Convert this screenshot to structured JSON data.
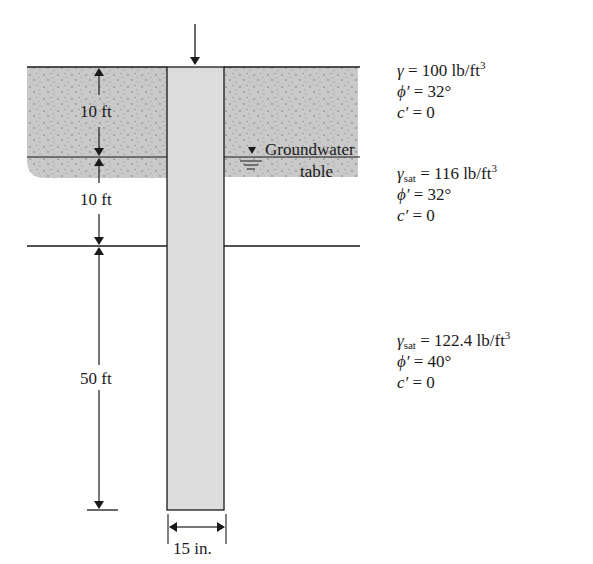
{
  "diagram": {
    "type": "pile-in-layered-soil",
    "colors": {
      "soil_fill": "#c9c9c9",
      "pile_fill": "#dcdcdc",
      "line": "#1a1a1a",
      "background": "#ffffff"
    },
    "load_arrow": "downward-load-arrow",
    "groundwater_label_line1": "Groundwater",
    "groundwater_label_line2": "table",
    "dimensions": {
      "layer1_thickness": "10 ft",
      "layer2_thickness": "10 ft",
      "layer3_thickness": "50 ft",
      "pile_diameter": "15 in."
    },
    "layers": [
      {
        "unit_weight_symbol": "γ",
        "unit_weight_sub": "",
        "unit_weight_value": "= 100 lb/ft",
        "unit_weight_exp": "3",
        "friction_angle_symbol": "ϕ′",
        "friction_angle_value": "= 32°",
        "cohesion_symbol": "c′",
        "cohesion_value": "= 0"
      },
      {
        "unit_weight_symbol": "γ",
        "unit_weight_sub": "sat",
        "unit_weight_value": "= 116 lb/ft",
        "unit_weight_exp": "3",
        "friction_angle_symbol": "ϕ′",
        "friction_angle_value": "= 32°",
        "cohesion_symbol": "c′",
        "cohesion_value": "= 0"
      },
      {
        "unit_weight_symbol": "γ",
        "unit_weight_sub": "sat",
        "unit_weight_value": "= 122.4 lb/ft",
        "unit_weight_exp": "3",
        "friction_angle_symbol": "ϕ′",
        "friction_angle_value": "= 40°",
        "cohesion_symbol": "c′",
        "cohesion_value": "= 0"
      }
    ]
  }
}
